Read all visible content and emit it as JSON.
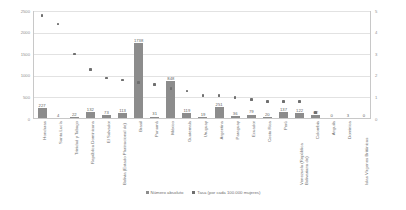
{
  "chart_data": {
    "type": "bar",
    "title": "",
    "subtitle": "",
    "xlabel": "",
    "ylabel": "",
    "y2label": "",
    "ylim": [
      0,
      2500
    ],
    "y2lim": [
      0,
      5
    ],
    "grid": true,
    "legend_position": "bottom",
    "yticks": [
      "0",
      "500",
      "1000",
      "1500",
      "2000",
      "2500"
    ],
    "ytick_values": [
      0,
      500,
      1000,
      1500,
      2000,
      2500
    ],
    "y2ticks": [
      "0",
      "1",
      "2",
      "3",
      "4",
      "5"
    ],
    "y2tick_values": [
      0,
      1,
      2,
      3,
      4,
      5
    ],
    "categories": [
      "Honduras",
      "Santa Lucía",
      "Trinidad y Tabago",
      "República Dominicana",
      "El Salvador",
      "Bolivia (Estado Plurinacional de)",
      "Brasil",
      "Panamá",
      "México",
      "Guatemala",
      "Uruguay",
      "Argentina",
      "Paraguay",
      "Ecuador",
      "Costa Rica",
      "Perú",
      "Venezuela (República Bolivariana de)",
      "Colombia",
      "Anguila",
      "Dominica",
      "Islas Vírgenes Británicas"
    ],
    "series": [
      {
        "name": "Número absoluto",
        "type": "bar",
        "axis": "left",
        "color": "#8c8c8c",
        "values": [
          227,
          4,
          22,
          132,
          73,
          113,
          1738,
          31,
          848,
          119,
          19,
          251,
          36,
          79,
          20,
          137,
          122,
          62,
          0,
          3,
          0
        ],
        "labels": [
          "227",
          "4",
          "22",
          "132",
          "73",
          "113",
          "1738",
          "31",
          "848",
          "119",
          "19",
          "251",
          "36",
          "79",
          "20",
          "137",
          "122",
          "62",
          "0",
          "3",
          "0"
        ]
      },
      {
        "name": "Tasa (por cada 100.000 mujeres)",
        "type": "scatter",
        "axis": "right",
        "color": "#6f6f6f",
        "values": [
          4.8,
          4.4,
          3.0,
          2.3,
          1.9,
          1.8,
          1.7,
          1.6,
          1.4,
          1.3,
          1.1,
          1.1,
          1.0,
          0.9,
          0.8,
          0.8,
          0.8,
          0.3,
          0.0,
          0.0,
          0.0
        ]
      }
    ]
  },
  "legend": {
    "items": [
      {
        "label": "Número absoluto",
        "marker": "square-swatch"
      },
      {
        "label": "Tasa (por cada 100.000 mujeres)",
        "marker": "dot-swatch"
      }
    ]
  }
}
